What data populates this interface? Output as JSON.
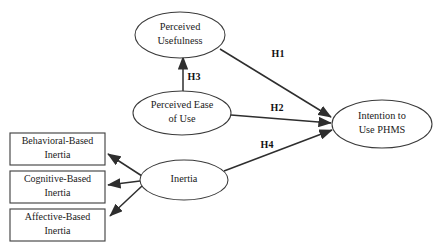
{
  "diagram": {
    "type": "path-model",
    "background_color": "#ffffff",
    "line_color": "#2e2e2e",
    "shape_fill": "#ffffff",
    "nodes": {
      "perceived_usefulness": {
        "label_line1": "Perceived",
        "label_line2": "Usefulness",
        "shape": "ellipse",
        "cx": 180,
        "cy": 35,
        "rx": 45,
        "ry": 23
      },
      "perceived_ease_of_use": {
        "label_line1": "Perceived Ease",
        "label_line2": "of Use",
        "shape": "ellipse",
        "cx": 182,
        "cy": 113,
        "rx": 49,
        "ry": 22
      },
      "intention_to_use": {
        "label_line1": "Intention to",
        "label_line2": "Use PHMS",
        "shape": "ellipse",
        "cx": 382,
        "cy": 124,
        "rx": 50,
        "ry": 24
      },
      "inertia": {
        "label_line1": "Inertia",
        "label_line2": "",
        "shape": "ellipse",
        "cx": 184,
        "cy": 180,
        "rx": 44,
        "ry": 20
      },
      "behavioral_based_inertia": {
        "label_line1": "Behavioral-Based",
        "label_line2": "Inertia",
        "shape": "rect",
        "x": 10,
        "y": 133,
        "w": 95,
        "h": 32
      },
      "cognitive_based_inertia": {
        "label_line1": "Cognitive-Based",
        "label_line2": "Inertia",
        "shape": "rect",
        "x": 10,
        "y": 171,
        "w": 95,
        "h": 32
      },
      "affective_based_inertia": {
        "label_line1": "Affective-Based",
        "label_line2": "Inertia",
        "shape": "rect",
        "x": 10,
        "y": 209,
        "w": 95,
        "h": 32
      }
    },
    "edges": {
      "h1": {
        "label": "H1",
        "from": "perceived_usefulness",
        "to": "intention_to_use",
        "label_x": 278,
        "label_y": 55
      },
      "h2": {
        "label": "H2",
        "from": "perceived_ease_of_use",
        "to": "intention_to_use",
        "label_x": 277,
        "label_y": 112
      },
      "h3": {
        "label": "H3",
        "from": "perceived_ease_of_use",
        "to": "perceived_usefulness",
        "label_x": 193,
        "label_y": 77
      },
      "h4": {
        "label": "H4",
        "from": "inertia",
        "to": "intention_to_use",
        "label_x": 267,
        "label_y": 146
      },
      "inertia_to_behavioral": {
        "label": "",
        "from": "inertia",
        "to": "behavioral_based_inertia"
      },
      "inertia_to_cognitive": {
        "label": "",
        "from": "inertia",
        "to": "cognitive_based_inertia"
      },
      "inertia_to_affective": {
        "label": "",
        "from": "inertia",
        "to": "affective_based_inertia"
      }
    }
  }
}
